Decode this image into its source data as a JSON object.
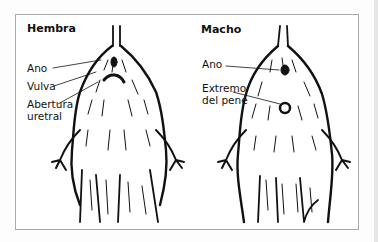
{
  "figure": {
    "panels": [
      {
        "title": "Hembra",
        "labels": [
          "Ano",
          "Vulva",
          "Abertura",
          "uretral"
        ]
      },
      {
        "title": "Macho",
        "labels": [
          "Ano",
          "Extremo",
          "del pene"
        ]
      }
    ],
    "colors": {
      "ink": "#111111",
      "frame": "#a9a9a9",
      "background": "#ffffff"
    }
  }
}
